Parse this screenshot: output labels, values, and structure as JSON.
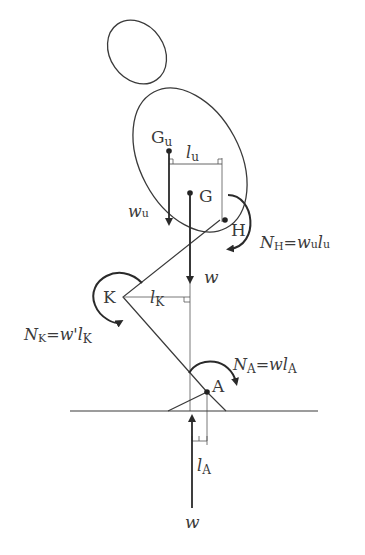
{
  "diagram": {
    "type": "free-body diagram of a crouching human figure",
    "points": {
      "Gu": {
        "label": "G",
        "sub": "u"
      },
      "G": {
        "label": "G"
      },
      "H": {
        "label": "H"
      },
      "K": {
        "label": "K"
      },
      "A": {
        "label": "A"
      }
    },
    "forces": {
      "wu": {
        "label": "w",
        "sub": "u"
      },
      "w_down": {
        "label": "w"
      },
      "w_up": {
        "label": "w"
      }
    },
    "lengths": {
      "lu": {
        "label": "l",
        "sub": "u"
      },
      "lK": {
        "label": "l",
        "sub": "K"
      },
      "lA": {
        "label": "l",
        "sub": "A"
      }
    },
    "moments": {
      "NH": {
        "N": "N",
        "sub": "H",
        "eq": "=",
        "rhs1": "w",
        "rhs1sub": "u",
        "rhs2": "l",
        "rhs2sub": "u"
      },
      "NK": {
        "N": "N",
        "sub": "K",
        "eq": "=",
        "rhs1": "w'",
        "rhs2": "l",
        "rhs2sub": "K"
      },
      "NA": {
        "N": "N",
        "sub": "A",
        "eq": "=",
        "rhs1": "w",
        "rhs2": "l",
        "rhs2sub": "A"
      }
    },
    "colors": {
      "stroke": "#3a3a3a",
      "background": "#ffffff"
    }
  }
}
